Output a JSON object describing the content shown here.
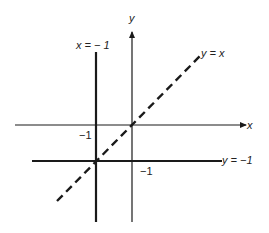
{
  "diagram": {
    "axes": {
      "x_label": "x",
      "y_label": "y"
    },
    "lines": [
      {
        "name": "x = -1",
        "label": "x = − 1",
        "style": "solid-thick"
      },
      {
        "name": "y = -1",
        "label": "y = −1",
        "style": "solid-thick"
      },
      {
        "name": "y = x",
        "label": "y = x",
        "style": "dashed"
      }
    ],
    "tick_labels": {
      "x_neg_one_on_x_axis": "−1",
      "y_neg_one_on_y_axis": "−1"
    },
    "colors": {
      "line": "#1a1a1a",
      "background": "#ffffff"
    }
  }
}
